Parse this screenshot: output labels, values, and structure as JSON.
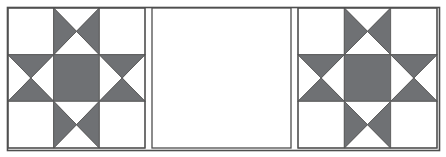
{
  "figure": {
    "width": 446,
    "height": 157,
    "background_color": "#ffffff",
    "outline_color": "#5a5a5a",
    "outline_width": 1.6,
    "frame": {
      "x": 7,
      "y": 7,
      "width": 432,
      "height": 143
    }
  },
  "palette": {
    "patch_light": "#ffffff",
    "patch_dark": "#6f7174",
    "seam_line": "#5a5a5a",
    "frame_line": "#4e4e4e",
    "panel_fill": "#ffffff"
  },
  "panels": [
    {
      "name": "left-block-panel",
      "kind": "pieced-block",
      "x": 8,
      "y": 8,
      "width": 137,
      "height": 140
    },
    {
      "name": "center-plain-panel",
      "kind": "plain",
      "x": 152,
      "y": 8,
      "width": 139,
      "height": 140,
      "fill": "#ffffff"
    },
    {
      "name": "right-block-panel",
      "kind": "pieced-block",
      "x": 298,
      "y": 8,
      "width": 139,
      "height": 140
    }
  ],
  "block": {
    "name": "ohio-star",
    "grid_rows": 3,
    "grid_cols": 3,
    "cells": [
      {
        "row": 0,
        "col": 0,
        "unit": "plain-light",
        "fill": "#ffffff"
      },
      {
        "row": 0,
        "col": 1,
        "unit": "hourglass-vertical-dark",
        "dark": "#6f7174",
        "light": "#ffffff"
      },
      {
        "row": 0,
        "col": 2,
        "unit": "plain-light",
        "fill": "#ffffff"
      },
      {
        "row": 1,
        "col": 0,
        "unit": "hourglass-horizontal-dark",
        "dark": "#6f7174",
        "light": "#ffffff"
      },
      {
        "row": 1,
        "col": 1,
        "unit": "plain-dark",
        "fill": "#6f7174"
      },
      {
        "row": 1,
        "col": 2,
        "unit": "hourglass-horizontal-dark",
        "dark": "#6f7174",
        "light": "#ffffff"
      },
      {
        "row": 2,
        "col": 0,
        "unit": "plain-light",
        "fill": "#ffffff"
      },
      {
        "row": 2,
        "col": 1,
        "unit": "hourglass-vertical-dark",
        "dark": "#6f7174",
        "light": "#ffffff"
      },
      {
        "row": 2,
        "col": 2,
        "unit": "plain-light",
        "fill": "#ffffff"
      }
    ]
  }
}
